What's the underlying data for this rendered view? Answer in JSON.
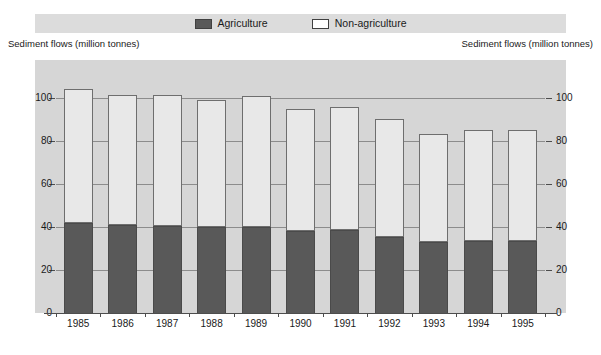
{
  "legend": {
    "items": [
      {
        "label": "Agriculture",
        "swatch": "dark-gray-filled",
        "color": "#595959"
      },
      {
        "label": "Non-agriculture",
        "swatch": "white-filled",
        "color": "#ffffff"
      }
    ]
  },
  "captions": {
    "left": "Sediment flows (million tonnes)",
    "right": "Sediment flows (million tonnes)"
  },
  "chart_data": {
    "type": "bar",
    "stacked": true,
    "title": "",
    "subtitle": "",
    "xlabel": "",
    "ylabel": "Sediment flows (million tonnes)",
    "ylabel_right": "Sediment flows (million tonnes)",
    "ylim": [
      0,
      110
    ],
    "yticks": [
      0,
      20,
      40,
      60,
      80,
      100
    ],
    "ytick_labels": [
      "0",
      "20",
      "40",
      "60",
      "80",
      "100"
    ],
    "grid": true,
    "legend_position": "top-center",
    "categories": [
      "1985",
      "1986",
      "1987",
      "1988",
      "1989",
      "1990",
      "1991",
      "1992",
      "1993",
      "1994",
      "1995"
    ],
    "series": [
      {
        "name": "Agriculture",
        "color": "#595959",
        "values": [
          42,
          41,
          40.5,
          40,
          40,
          38,
          38.5,
          35.5,
          33,
          33.5,
          33.5
        ]
      },
      {
        "name": "Non-agriculture",
        "color": "#e8e8e8",
        "values": [
          62,
          60,
          60.5,
          59,
          60.5,
          56.5,
          57,
          54.5,
          50,
          51.5,
          51.5
        ]
      }
    ],
    "totals": [
      104,
      101,
      101,
      99,
      100.5,
      94.5,
      95.5,
      90,
      83,
      85,
      85
    ]
  }
}
